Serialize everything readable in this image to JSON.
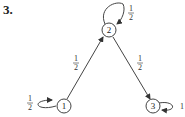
{
  "problem_number": "3.",
  "diagram": {
    "type": "markov-chain",
    "nodes": [
      {
        "id": "1",
        "label": "1"
      },
      {
        "id": "2",
        "label": "2"
      },
      {
        "id": "3",
        "label": "3"
      }
    ],
    "edges": [
      {
        "from": "1",
        "to": "1",
        "label_num": "1",
        "label_den": "2"
      },
      {
        "from": "1",
        "to": "2",
        "label_num": "1",
        "label_den": "2"
      },
      {
        "from": "2",
        "to": "2",
        "label_num": "1",
        "label_den": "2"
      },
      {
        "from": "2",
        "to": "3",
        "label_num": "1",
        "label_den": "2"
      },
      {
        "from": "3",
        "to": "3",
        "label": "1"
      }
    ]
  }
}
